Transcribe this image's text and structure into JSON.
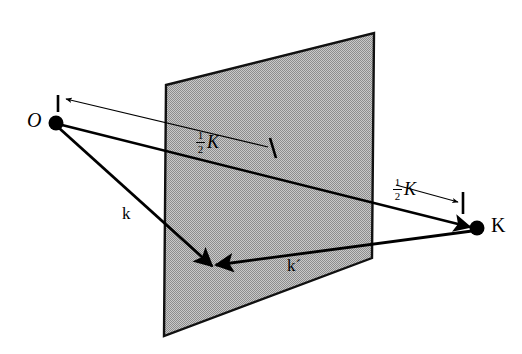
{
  "figure": {
    "kind": "vector-diagram",
    "background_color": "#ffffff",
    "ink_color": "#000000",
    "plane_fill_color": "#a8a8a8",
    "plane_edge_color": "#000000"
  },
  "labels": {
    "origin": "O",
    "incident_wavevector": "k",
    "scattered_wavevector": "k´",
    "scattering_vector": "K",
    "half_k_numerator": "1",
    "half_k_denominator": "2",
    "half_k_symbol": "K"
  },
  "points": {
    "origin": {
      "name": "O",
      "x": 56,
      "y": 123,
      "radius": 7
    },
    "scattering_point": {
      "name": "K",
      "x": 477,
      "y": 228,
      "radius": 7
    },
    "reflection_point": {
      "name": "bragg-plane-intersection",
      "x": 211,
      "y": 264
    }
  },
  "plane": {
    "name": "bragg-plane",
    "corners": [
      {
        "x": 166,
        "y": 85
      },
      {
        "x": 374,
        "y": 33
      },
      {
        "x": 372,
        "y": 258
      },
      {
        "x": 164,
        "y": 336
      }
    ]
  },
  "vectors": [
    {
      "name": "k-vector",
      "label": "k",
      "from_x": 56,
      "from_y": 123,
      "to_x": 211,
      "to_y": 264,
      "style": "thick-arrow"
    },
    {
      "name": "k-prime-vector",
      "label": "k´",
      "from_x": 477,
      "from_y": 228,
      "to_x": 211,
      "to_y": 264,
      "style": "thick-arrow"
    },
    {
      "name": "K-vector",
      "label": "K",
      "from_x": 56,
      "from_y": 123,
      "to_x": 477,
      "to_y": 228,
      "style": "thick-arrow"
    }
  ],
  "dimensions": [
    {
      "name": "half-k-left",
      "label": "1/2 K",
      "tick_x": 273,
      "tick_y": 148,
      "arrow_from_x": 268,
      "arrow_from_y": 147,
      "arrow_to_x": 63,
      "arrow_to_y": 98,
      "label_x": 196,
      "label_y": 136
    },
    {
      "name": "half-k-right",
      "label": "1/2 K",
      "tick_x": 463,
      "tick_y": 204,
      "arrow_from_x": 393,
      "arrow_from_y": 184,
      "arrow_to_x": 460,
      "arrow_to_y": 202,
      "label_x": 393,
      "label_y": 185
    }
  ],
  "label_positions": {
    "origin": {
      "x": 29,
      "y": 112
    },
    "k": {
      "x": 123,
      "y": 206
    },
    "k_prime": {
      "x": 288,
      "y": 258
    },
    "K": {
      "x": 492,
      "y": 216
    }
  }
}
